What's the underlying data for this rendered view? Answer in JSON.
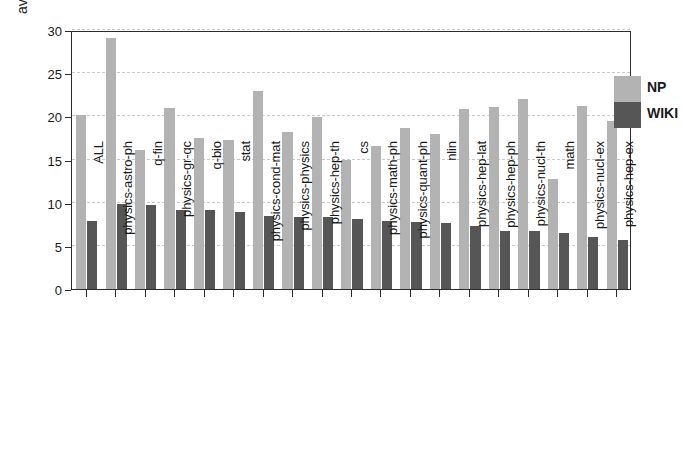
{
  "chart_data": {
    "type": "bar",
    "title": "",
    "xlabel": "",
    "ylabel": "average number of tags",
    "ylim": [
      0,
      30
    ],
    "yticks": [
      0,
      5,
      10,
      15,
      20,
      25,
      30
    ],
    "grid": true,
    "legend_position": "top-right",
    "categories": [
      "ALL",
      "physics-astro-ph",
      "q-fin",
      "physics-gr-qc",
      "q-bio",
      "stat",
      "physics-cond-mat",
      "physics-physics",
      "physics-hep-th",
      "cs",
      "physics-math-ph",
      "physics-quant-ph",
      "nlin",
      "physics-hep-lat",
      "physics-hep-ph",
      "physics-nucl-th",
      "math",
      "physics-nucl-ex",
      "physics-hep-ex"
    ],
    "series": [
      {
        "name": "NP",
        "color": "#b3b3b3",
        "values": [
          20.2,
          29.1,
          16.1,
          21.0,
          17.5,
          17.3,
          22.9,
          18.2,
          19.9,
          15.0,
          16.6,
          18.6,
          18.0,
          20.9,
          21.1,
          22.0,
          12.8,
          21.2,
          19.5
        ]
      },
      {
        "name": "WIKI",
        "color": "#565656",
        "values": [
          7.9,
          9.8,
          9.7,
          9.2,
          9.1,
          8.9,
          8.5,
          8.3,
          8.3,
          8.1,
          7.9,
          7.8,
          7.7,
          7.3,
          6.7,
          6.7,
          6.5,
          6.0,
          5.7
        ]
      }
    ]
  },
  "legend": {
    "items": [
      {
        "label": "NP",
        "color": "#b3b3b3"
      },
      {
        "label": "WIKI",
        "color": "#565656"
      }
    ]
  }
}
